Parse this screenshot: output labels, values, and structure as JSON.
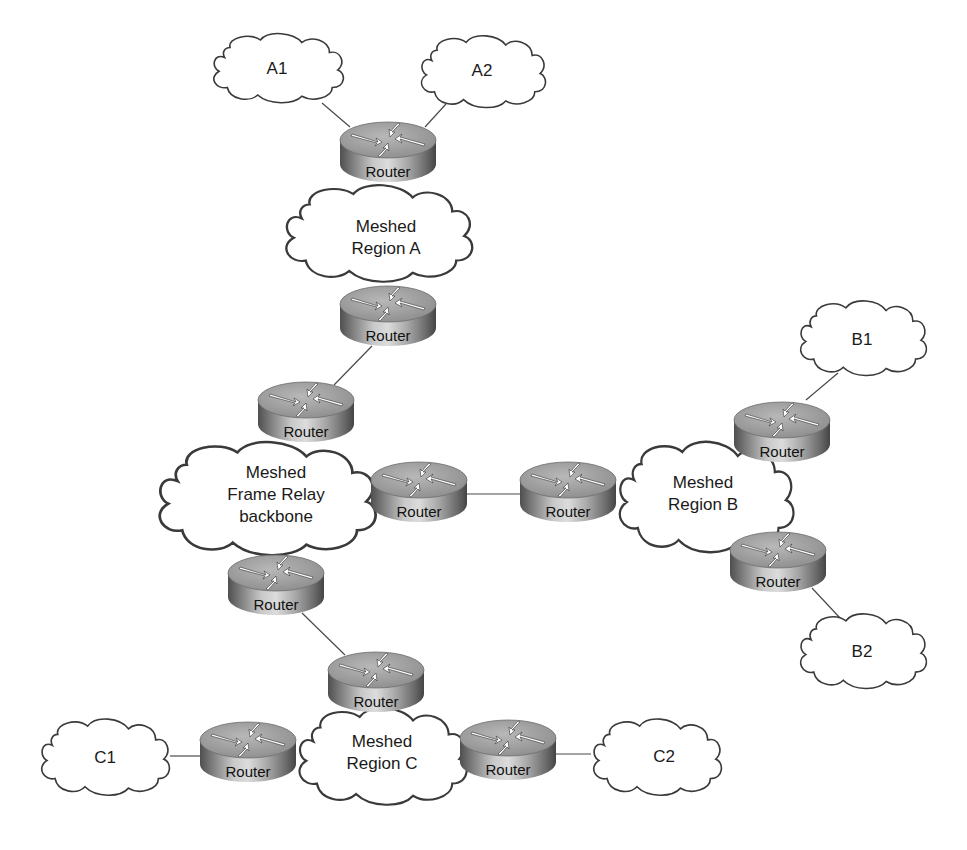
{
  "diagram": {
    "type": "network-topology",
    "colors": {
      "background": "#ffffff",
      "line": "#4a4a4a",
      "cloud_fill": "#ffffff",
      "cloud_stroke": "#3a3a3a",
      "router_top": "#9a9a9a",
      "router_side_dark": "#5c5c5c",
      "router_side_light": "#cfcfcf",
      "router_arrow": "#ffffff"
    },
    "router_label": "Router",
    "clouds": {
      "a1": {
        "lines": [
          "A1"
        ]
      },
      "a2": {
        "lines": [
          "A2"
        ]
      },
      "region_a": {
        "lines": [
          "Meshed",
          "Region A"
        ]
      },
      "backbone": {
        "lines": [
          "Meshed",
          "Frame Relay",
          "backbone"
        ]
      },
      "region_b": {
        "lines": [
          "Meshed",
          "Region B"
        ]
      },
      "b1": {
        "lines": [
          "B1"
        ]
      },
      "b2": {
        "lines": [
          "B2"
        ]
      },
      "region_c": {
        "lines": [
          "Meshed",
          "Region C"
        ]
      },
      "c1": {
        "lines": [
          "C1"
        ]
      },
      "c2": {
        "lines": [
          "C2"
        ]
      }
    },
    "routers": {
      "a_top": {
        "label": "Router"
      },
      "a_bottom": {
        "label": "Router"
      },
      "bb_top": {
        "label": "Router"
      },
      "bb_right": {
        "label": "Router"
      },
      "bb_bottom": {
        "label": "Router"
      },
      "b_left": {
        "label": "Router"
      },
      "b_top": {
        "label": "Router"
      },
      "b_bottom": {
        "label": "Router"
      },
      "c_top": {
        "label": "Router"
      },
      "c_left": {
        "label": "Router"
      },
      "c_right": {
        "label": "Router"
      }
    },
    "links": [
      [
        "A1",
        "Router (A top)"
      ],
      [
        "A2",
        "Router (A top)"
      ],
      [
        "Router (A top)",
        "Meshed Region A"
      ],
      [
        "Meshed Region A",
        "Router (A bottom)"
      ],
      [
        "Router (A bottom)",
        "Router (backbone top)"
      ],
      [
        "Router (backbone top)",
        "Meshed Frame Relay backbone"
      ],
      [
        "Meshed Frame Relay backbone",
        "Router (backbone right)"
      ],
      [
        "Router (backbone right)",
        "Router (B left)"
      ],
      [
        "Router (B left)",
        "Meshed Region B"
      ],
      [
        "Meshed Region B",
        "Router (B top)"
      ],
      [
        "Router (B top)",
        "B1"
      ],
      [
        "Meshed Region B",
        "Router (B bottom)"
      ],
      [
        "Router (B bottom)",
        "B2"
      ],
      [
        "Meshed Frame Relay backbone",
        "Router (backbone bottom)"
      ],
      [
        "Router (backbone bottom)",
        "Router (C top)"
      ],
      [
        "Router (C top)",
        "Meshed Region C"
      ],
      [
        "Meshed Region C",
        "Router (C left)"
      ],
      [
        "Router (C left)",
        "C1"
      ],
      [
        "Meshed Region C",
        "Router (C right)"
      ],
      [
        "Router (C right)",
        "C2"
      ]
    ]
  }
}
